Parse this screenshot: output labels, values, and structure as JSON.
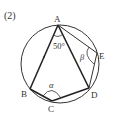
{
  "problem_number": "(2)",
  "colors": {
    "line": "#222222",
    "circle": "#333333",
    "text": "#333333",
    "background": "#ffffff"
  },
  "circle": {
    "cx": 60,
    "cy": 64,
    "r": 39
  },
  "points": {
    "A": {
      "label": "A",
      "x": 58,
      "y": 25
    },
    "B": {
      "label": "B",
      "x": 30,
      "y": 89
    },
    "C": {
      "label": "C",
      "x": 52,
      "y": 101
    },
    "D": {
      "label": "D",
      "x": 89,
      "y": 88
    },
    "E": {
      "label": "E",
      "x": 97,
      "y": 53
    }
  },
  "angles": {
    "angle_A": "50°",
    "alpha": "α",
    "beta": "β"
  }
}
